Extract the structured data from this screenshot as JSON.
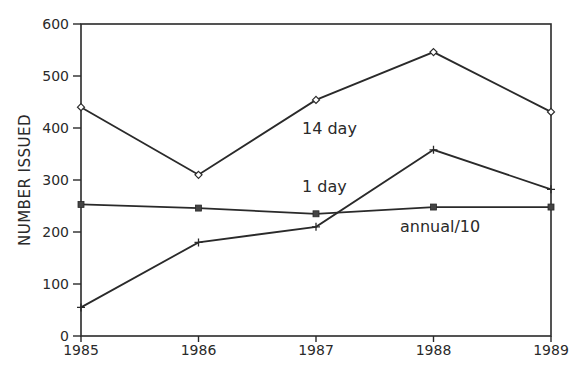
{
  "chart_data": {
    "type": "line",
    "title": "",
    "xlabel": "",
    "ylabel": "NUMBER ISSUED",
    "x": [
      "1985",
      "1986",
      "1987",
      "1988",
      "1989"
    ],
    "ylim": [
      0,
      600
    ],
    "yticks": [
      "0",
      "100",
      "200",
      "300",
      "400",
      "500",
      "600"
    ],
    "grid": false,
    "legend": "inline labels",
    "series": [
      {
        "name": "14 day",
        "marker": "diamond",
        "values": [
          440,
          310,
          454,
          546,
          431
        ],
        "label_pos": {
          "x": 302,
          "y": 134
        }
      },
      {
        "name": "1 day",
        "marker": "plus",
        "values": [
          55,
          180,
          210,
          358,
          282
        ],
        "label_pos": {
          "x": 302,
          "y": 192
        }
      },
      {
        "name": "annual/10",
        "marker": "square",
        "values": [
          253,
          246,
          235,
          248,
          248
        ],
        "label_pos": {
          "x": 400,
          "y": 232
        }
      }
    ]
  }
}
